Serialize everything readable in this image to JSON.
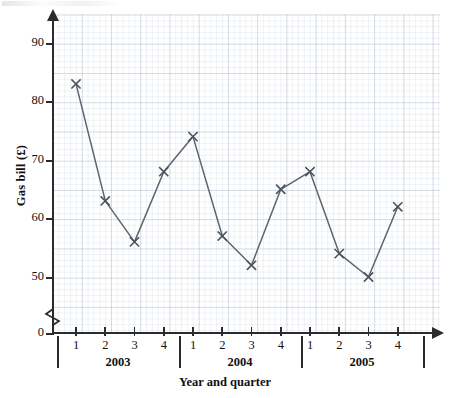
{
  "chart_data": {
    "type": "line",
    "title": "",
    "xlabel": "Year and quarter",
    "ylabel": "Gas bill (£)",
    "categories": [
      "2003 Q1",
      "2003 Q2",
      "2003 Q3",
      "2003 Q4",
      "2004 Q1",
      "2004 Q2",
      "2004 Q3",
      "2004 Q4",
      "2005 Q1",
      "2005 Q2",
      "2005 Q3",
      "2005 Q4"
    ],
    "values": [
      83,
      63,
      56,
      68,
      74,
      57,
      52,
      65,
      68,
      54,
      50,
      62
    ],
    "ylim": [
      0,
      95
    ],
    "y_axis_break": true,
    "y_ticks": [
      90,
      80,
      70,
      60,
      50,
      0
    ],
    "y_tick_labels": [
      "90",
      "80",
      "70",
      "60",
      "50",
      "0"
    ],
    "x_quarter_labels": [
      "1",
      "2",
      "3",
      "4",
      "1",
      "2",
      "3",
      "4",
      "1",
      "2",
      "3",
      "4"
    ],
    "x_year_groups": [
      "2003",
      "2004",
      "2005"
    ],
    "grid": true,
    "minor_grid": true,
    "legend": "none",
    "marker": "x-cross",
    "line_color": "#5c6470",
    "marker_color": "#4a525c",
    "grid_color": "#9aa8be",
    "axis_color": "#2b2b2b"
  },
  "axis": {
    "y_title": "Gas bill (£)",
    "x_title": "Year and quarter"
  }
}
